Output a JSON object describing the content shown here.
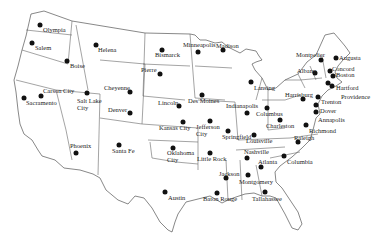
{
  "capitals": [
    {
      "name": "Olympia",
      "dot": [
        40,
        25
      ],
      "label": [
        43,
        27
      ]
    },
    {
      "name": "Salem",
      "dot": [
        32,
        43
      ],
      "label": [
        35,
        45
      ]
    },
    {
      "name": "Boise",
      "dot": [
        67,
        61
      ],
      "label": [
        70,
        63
      ]
    },
    {
      "name": "Helena",
      "dot": [
        96,
        45
      ],
      "label": [
        98,
        47
      ]
    },
    {
      "name": "Carson City",
      "dot": [
        41,
        96
      ],
      "label": [
        43,
        88
      ]
    },
    {
      "name": "Sacramento",
      "dot": [
        24,
        98
      ],
      "label": [
        26,
        100
      ]
    },
    {
      "name": "Salt Lake\nCity",
      "dot": [
        87,
        93
      ],
      "label": [
        77,
        98
      ]
    },
    {
      "name": "Cheyenne",
      "dot": [
        130,
        92
      ],
      "label": [
        104,
        85
      ]
    },
    {
      "name": "Denver",
      "dot": [
        130,
        113
      ],
      "label": [
        108,
        107
      ]
    },
    {
      "name": "Phoenix",
      "dot": [
        76,
        153
      ],
      "label": [
        70,
        143
      ]
    },
    {
      "name": "Santa Fe",
      "dot": [
        119,
        145
      ],
      "label": [
        112,
        148
      ]
    },
    {
      "name": "Bismarck",
      "dot": [
        162,
        50
      ],
      "label": [
        155,
        52
      ]
    },
    {
      "name": "Pierre",
      "dot": [
        160,
        74
      ],
      "label": [
        141,
        67
      ]
    },
    {
      "name": "Lincoln",
      "dot": [
        179,
        106
      ],
      "label": [
        158,
        100
      ]
    },
    {
      "name": "Kansas City",
      "dot": [
        183,
        122
      ],
      "label": [
        159,
        125
      ]
    },
    {
      "name": "Oklahoma\nCity",
      "dot": [
        173,
        148
      ],
      "label": [
        167,
        150
      ]
    },
    {
      "name": "Austin",
      "dot": [
        165,
        192
      ],
      "label": [
        168,
        195
      ]
    },
    {
      "name": "Minneapolis",
      "dot": [
        198,
        52
      ],
      "label": [
        183,
        42
      ]
    },
    {
      "name": "Des Moines",
      "dot": [
        202,
        95
      ],
      "label": [
        188,
        98
      ]
    },
    {
      "name": "Jefferson\nCity",
      "dot": [
        210,
        121
      ],
      "label": [
        196,
        124
      ]
    },
    {
      "name": "Little Rock",
      "dot": [
        210,
        153
      ],
      "label": [
        197,
        156
      ]
    },
    {
      "name": "Madison",
      "dot": [
        223,
        50
      ],
      "label": [
        216,
        43
      ]
    },
    {
      "name": "Lansing",
      "dot": [
        251,
        82
      ],
      "label": [
        254,
        85
      ]
    },
    {
      "name": "Springfield",
      "dot": [
        228,
        131
      ],
      "label": [
        222,
        134
      ]
    },
    {
      "name": "Indianapolis",
      "dot": [
        247,
        113
      ],
      "label": [
        226,
        103
      ]
    },
    {
      "name": "Columbus",
      "dot": [
        267,
        108
      ],
      "label": [
        256,
        111
      ]
    },
    {
      "name": "Louisville",
      "dot": [
        254,
        135
      ],
      "label": [
        246,
        138
      ]
    },
    {
      "name": "Charleston",
      "dot": [
        280,
        120
      ],
      "label": [
        266,
        123
      ]
    },
    {
      "name": "Nashville",
      "dot": [
        247,
        158
      ],
      "label": [
        244,
        149
      ]
    },
    {
      "name": "Jackson",
      "dot": [
        226,
        178
      ],
      "label": [
        219,
        171
      ]
    },
    {
      "name": "Baton Rouge",
      "dot": [
        217,
        193
      ],
      "label": [
        203,
        196
      ]
    },
    {
      "name": "Montgomery",
      "dot": [
        248,
        175
      ],
      "label": [
        239,
        179
      ]
    },
    {
      "name": "Atlanta",
      "dot": [
        261,
        167
      ],
      "label": [
        258,
        159
      ]
    },
    {
      "name": "Tallahassee",
      "dot": [
        265,
        192
      ],
      "label": [
        252,
        196
      ]
    },
    {
      "name": "Columbia",
      "dot": [
        284,
        156
      ],
      "label": [
        287,
        159
      ]
    },
    {
      "name": "Raleigh",
      "dot": [
        298,
        142
      ],
      "label": [
        294,
        135
      ]
    },
    {
      "name": "Richmond",
      "dot": [
        306,
        125
      ],
      "label": [
        309,
        128
      ]
    },
    {
      "name": "Annapolis",
      "dot": [
        316,
        112
      ],
      "label": [
        318,
        117
      ]
    },
    {
      "name": "Dover",
      "dot": [
        316,
        105
      ],
      "label": [
        320,
        108
      ]
    },
    {
      "name": "Harrisburg",
      "dot": [
        303,
        99
      ],
      "label": [
        285,
        92
      ]
    },
    {
      "name": "Trenton",
      "dot": [
        318,
        97
      ],
      "label": [
        321,
        99
      ]
    },
    {
      "name": "Albany",
      "dot": [
        315,
        73
      ],
      "label": [
        297,
        68
      ]
    },
    {
      "name": "Montpelier",
      "dot": [
        321,
        60
      ],
      "label": [
        296,
        52
      ]
    },
    {
      "name": "Augusta",
      "dot": [
        336,
        58
      ],
      "label": [
        339,
        55
      ]
    },
    {
      "name": "Concord",
      "dot": [
        330,
        71
      ],
      "label": [
        332,
        66
      ]
    },
    {
      "name": "Boston",
      "dot": [
        333,
        76
      ],
      "label": [
        336,
        72
      ]
    },
    {
      "name": "Hartford",
      "dot": [
        328,
        83
      ],
      "label": [
        336,
        85
      ]
    },
    {
      "name": "Providence",
      "dot": [
        332,
        86
      ],
      "label": [
        341,
        94
      ]
    }
  ]
}
